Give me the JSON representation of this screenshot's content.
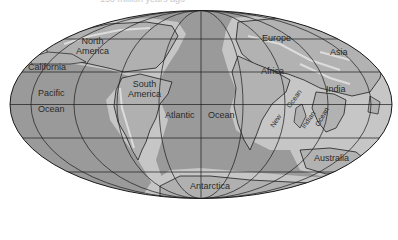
{
  "caption": "150 million years ago",
  "map": {
    "projection": "Mollweide-style world map",
    "colors": {
      "ocean": "#9a9a9a",
      "shelf": "#c4c4c4",
      "land": "#b2b2b2",
      "mountain": "#d6d6d6",
      "outline": "#1e1e1e",
      "grid": "#1a1a1a",
      "background": "#ffffff"
    },
    "labels": {
      "north_america": "North\nAmerica",
      "north": "North",
      "america": "America",
      "california": "California",
      "pacific": "Pacific",
      "pacific_ocean": "Ocean",
      "south": "South",
      "south_america": "America",
      "atlantic": "Atlantic",
      "atlantic_ocean": "Ocean",
      "europe": "Europe",
      "asia": "Asia",
      "africa": "Africa",
      "india": "India",
      "new": "New",
      "new_ocean": "Ocean",
      "indian": "Indian",
      "indian_ocean": "Ocean",
      "australia": "Australia",
      "antarctica": "Antarctica"
    }
  }
}
